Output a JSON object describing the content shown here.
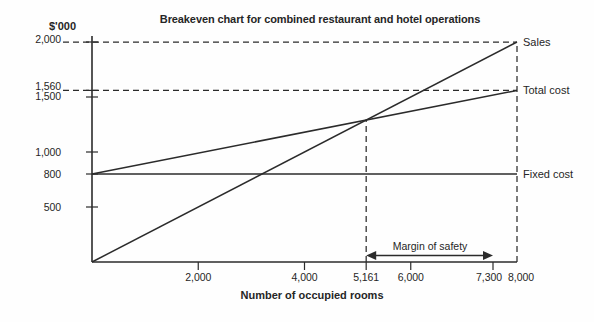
{
  "title": "Breakeven chart for combined restaurant and hotel operations",
  "colors": {
    "ink": "#2b2b2b",
    "paper": "#fefefe"
  },
  "y_axis": {
    "unit": "$'000",
    "range": [
      0,
      2000
    ],
    "ticks": [
      {
        "label": "2,000",
        "value": 2000,
        "dashed_line": true
      },
      {
        "label": "1,560",
        "value": 1560,
        "dashed_line": true
      },
      {
        "label": "1,500",
        "value": 1500,
        "dashed_line": false
      },
      {
        "label": "1,000",
        "value": 1000,
        "dashed_line": false
      },
      {
        "label": "800",
        "value": 800,
        "dashed_line": false
      },
      {
        "label": "500",
        "value": 500,
        "dashed_line": false
      }
    ]
  },
  "x_axis": {
    "label": "Number of occupied rooms",
    "range": [
      0,
      8000
    ],
    "ticks": [
      {
        "label": "2,000",
        "value": 2000
      },
      {
        "label": "4,000",
        "value": 4000
      },
      {
        "label": "5,161",
        "value": 5161
      },
      {
        "label": "6,000",
        "value": 6000
      },
      {
        "label": "7,300",
        "value": 7300
      },
      {
        "label": "8,000",
        "value": 8000
      }
    ]
  },
  "chart_data": {
    "type": "line",
    "title": "Breakeven chart for combined restaurant and hotel operations",
    "xlabel": "Number of occupied rooms",
    "ylabel": "$'000",
    "xlim": [
      0,
      8000
    ],
    "ylim": [
      0,
      2000
    ],
    "grid": false,
    "series": [
      {
        "name": "Sales",
        "points": [
          [
            0,
            0
          ],
          [
            8000,
            2000
          ]
        ]
      },
      {
        "name": "Total cost",
        "points": [
          [
            0,
            800
          ],
          [
            8000,
            1560
          ]
        ]
      },
      {
        "name": "Fixed cost",
        "points": [
          [
            0,
            800
          ],
          [
            8000,
            800
          ]
        ]
      }
    ],
    "breakeven_x": 5161,
    "activity_level_x": 8000,
    "sales_at_max": 2000,
    "total_cost_at_max": 1560,
    "fixed_cost": 800,
    "annotation": {
      "label": "Margin of safety",
      "from_x": 5161,
      "to_x": 7300
    }
  }
}
